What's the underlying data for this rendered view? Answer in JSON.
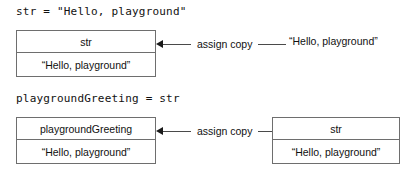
{
  "diagram": {
    "type": "value-semantics-assignment",
    "background_color": "#ffffff",
    "line_color": "#6e6e6e",
    "text_color": "#111111"
  },
  "rows": [
    {
      "code_label": "str = \"Hello, playground\"",
      "left_box": {
        "name": "str",
        "value": "“Hello, playground”"
      },
      "connector_label": "assign copy",
      "right_text": "“Hello, playground”"
    },
    {
      "code_label": "playgroundGreeting = str",
      "left_box": {
        "name": "playgroundGreeting",
        "value": "“Hello, playground”"
      },
      "connector_label": "assign copy",
      "right_box": {
        "name": "str",
        "value": "“Hello, playground”"
      }
    }
  ]
}
